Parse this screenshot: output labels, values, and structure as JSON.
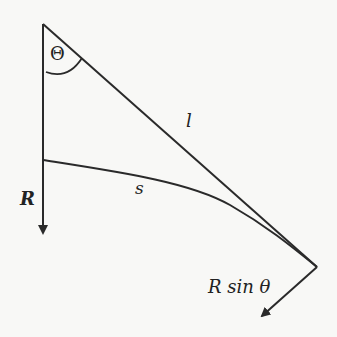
{
  "diagram": {
    "labels": {
      "angle": "Θ",
      "vector_r": "R",
      "chord": "l",
      "arc": "s",
      "component": "R sin θ"
    },
    "colors": {
      "stroke": "#2a2a2a",
      "background": "#f8f8f6"
    }
  }
}
